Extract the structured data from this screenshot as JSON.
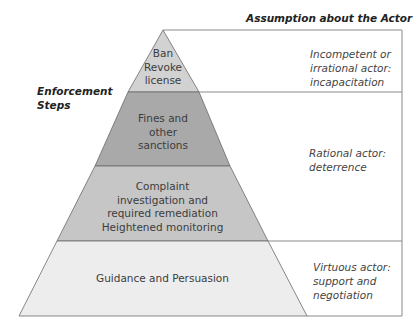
{
  "diagram": {
    "header": "Assumption about the Actor",
    "side_label": "Enforcement Steps",
    "levels": [
      {
        "step": "Ban\nRevoke\nlicense",
        "step_lines": [
          "Ban",
          "Revoke",
          "license"
        ],
        "color": "#d2d2d2"
      },
      {
        "step": "Fines and other sanctions",
        "step_lines": [
          "Fines and",
          "other",
          "sanctions"
        ],
        "color": "#a9a9a9"
      },
      {
        "step": "Complaint investigation and required remediation Heightened monitoring",
        "step_lines": [
          "Complaint",
          "investigation and",
          "required remediation",
          "Heightened monitoring"
        ],
        "color": "#c6c6c6"
      },
      {
        "step": "Guidance and Persuasion",
        "step_lines": [
          "Guidance and Persuasion"
        ],
        "color": "#ededed"
      }
    ],
    "assumptions": [
      {
        "lines": [
          "Incompetent or",
          "irrational actor:",
          "incapacitation"
        ]
      },
      {
        "lines": [
          "Rational actor:",
          "deterrence"
        ]
      },
      {
        "lines": [
          "Virtuous actor:",
          "support and",
          "negotiation"
        ]
      }
    ]
  }
}
